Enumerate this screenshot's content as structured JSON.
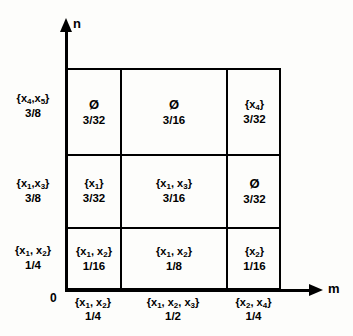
{
  "figure": {
    "axes": {
      "y_label": "n",
      "x_label": "m",
      "origin_label": "0"
    },
    "row_labels": [
      {
        "set": "{x4,x5}",
        "value": "3/8"
      },
      {
        "set": "{x1,x3}",
        "value": "3/8"
      },
      {
        "set": "{x1, x2}",
        "value": "1/4"
      }
    ],
    "column_labels": [
      {
        "set": "{x1, x2}",
        "value": "1/4"
      },
      {
        "set": "{x1, x2, x3}",
        "value": "1/2"
      },
      {
        "set": "{x2, x4}",
        "value": "1/4"
      }
    ],
    "cells": [
      [
        {
          "set": "Ø",
          "value": "3/32",
          "empty": true
        },
        {
          "set": "Ø",
          "value": "3/16",
          "empty": true
        },
        {
          "set": "{x4}",
          "value": "3/32",
          "empty": false
        }
      ],
      [
        {
          "set": "{x1}",
          "value": "3/32",
          "empty": false
        },
        {
          "set": "{x1, x3}",
          "value": "3/16",
          "empty": false
        },
        {
          "set": "Ø",
          "value": "3/32",
          "empty": true
        }
      ],
      [
        {
          "set": "{x1, x2}",
          "value": "1/16",
          "empty": false
        },
        {
          "set": "{x1, x2}",
          "value": "1/8",
          "empty": false
        },
        {
          "set": "{x2}",
          "value": "1/16",
          "empty": false
        }
      ]
    ],
    "colors": {
      "line": "#000000",
      "background": "#fdfdfb"
    }
  }
}
